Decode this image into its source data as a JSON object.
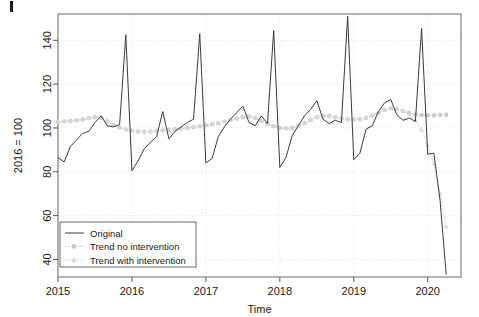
{
  "chart_data": {
    "type": "line",
    "title": "",
    "xlabel": "Time",
    "ylabel": "2016 = 100",
    "xlim": [
      2015.0,
      2020.45
    ],
    "ylim": [
      32,
      152
    ],
    "grid": true,
    "x_ticks": [
      2015,
      2016,
      2017,
      2018,
      2019,
      2020
    ],
    "x_tick_labels": [
      "2015",
      "2016",
      "2017",
      "2018",
      "2019",
      "2020"
    ],
    "y_ticks": [
      40,
      60,
      80,
      100,
      120,
      140
    ],
    "y_tick_labels": [
      "40",
      "60",
      "80",
      "100",
      "120",
      "140"
    ],
    "legend_position": "bottom-left",
    "colors": {
      "original": "#3a3a3a",
      "trend_no_intervention": "#c9c9c9",
      "trend_with_intervention": "#d6d6d6",
      "axis": "#555555",
      "grid": "#e4e4e4",
      "box": "#6b6b6b"
    },
    "x": [
      2015.0,
      2015.083,
      2015.167,
      2015.25,
      2015.333,
      2015.417,
      2015.5,
      2015.583,
      2015.667,
      2015.75,
      2015.833,
      2015.917,
      2016.0,
      2016.083,
      2016.167,
      2016.25,
      2016.333,
      2016.417,
      2016.5,
      2016.583,
      2016.667,
      2016.75,
      2016.833,
      2016.917,
      2017.0,
      2017.083,
      2017.167,
      2017.25,
      2017.333,
      2017.417,
      2017.5,
      2017.583,
      2017.667,
      2017.75,
      2017.833,
      2017.917,
      2018.0,
      2018.083,
      2018.167,
      2018.25,
      2018.333,
      2018.417,
      2018.5,
      2018.583,
      2018.667,
      2018.75,
      2018.833,
      2018.917,
      2019.0,
      2019.083,
      2019.167,
      2019.25,
      2019.333,
      2019.417,
      2019.5,
      2019.583,
      2019.667,
      2019.75,
      2019.833,
      2019.917,
      2020.0,
      2020.083,
      2020.167,
      2020.25
    ],
    "series": [
      {
        "name": "Original",
        "style": "solid-line",
        "values": [
          86.5,
          84.5,
          91.5,
          94.5,
          97.5,
          98.5,
          102.5,
          105.5,
          101.0,
          100.5,
          101.5,
          142.5,
          80.5,
          85.0,
          90.5,
          93.5,
          96.0,
          107.5,
          95.0,
          98.5,
          100.5,
          102.5,
          104.0,
          143.0,
          84.0,
          86.0,
          96.0,
          100.5,
          104.0,
          107.0,
          110.0,
          102.5,
          101.0,
          105.5,
          102.0,
          144.5,
          82.0,
          86.5,
          96.5,
          101.0,
          105.5,
          108.5,
          112.5,
          104.0,
          102.0,
          103.5,
          102.5,
          151.0,
          85.5,
          88.5,
          99.5,
          101.0,
          107.5,
          111.5,
          113.0,
          106.0,
          103.5,
          104.5,
          103.0,
          145.5,
          88.0,
          88.5,
          67.0,
          33.0
        ]
      },
      {
        "name": "Trend no intervention",
        "style": "dotted-line-circles",
        "values": [
          102.8,
          103.0,
          103.2,
          103.5,
          103.9,
          104.4,
          104.9,
          104.6,
          103.0,
          101.4,
          100.2,
          99.3,
          98.7,
          98.4,
          98.3,
          98.4,
          98.6,
          98.9,
          99.1,
          99.4,
          99.7,
          100.0,
          100.4,
          100.8,
          101.2,
          101.7,
          102.2,
          102.9,
          103.6,
          104.3,
          105.0,
          105.2,
          104.6,
          103.3,
          101.9,
          100.8,
          100.1,
          99.8,
          100.0,
          100.8,
          102.1,
          103.6,
          104.9,
          105.6,
          105.5,
          104.9,
          104.3,
          103.9,
          103.8,
          104.0,
          104.6,
          105.6,
          106.9,
          108.2,
          109.0,
          108.7,
          107.7,
          106.8,
          106.2,
          105.9,
          105.8,
          105.8,
          105.9,
          106.0
        ]
      },
      {
        "name": "Trend with intervention",
        "style": "dotted-line-triangles",
        "values": [
          102.9,
          103.1,
          103.3,
          103.6,
          104.0,
          104.5,
          105.0,
          104.7,
          103.1,
          101.5,
          100.3,
          99.4,
          98.8,
          98.5,
          98.4,
          98.5,
          98.7,
          99.0,
          99.2,
          99.5,
          99.8,
          100.1,
          100.5,
          100.9,
          101.3,
          101.8,
          102.3,
          103.0,
          103.7,
          104.4,
          105.1,
          105.3,
          104.7,
          103.4,
          102.0,
          100.9,
          100.2,
          99.9,
          100.1,
          100.9,
          102.2,
          103.7,
          105.0,
          105.7,
          105.6,
          105.0,
          104.4,
          104.0,
          103.9,
          104.1,
          104.7,
          105.7,
          107.0,
          108.3,
          109.1,
          108.8,
          107.8,
          106.0,
          103.5,
          99.0,
          92.0,
          83.5,
          70.0,
          55.0
        ]
      }
    ]
  },
  "axes": {
    "x_axis_title": "Time",
    "y_axis_title": "2016 = 100"
  },
  "legend": {
    "entries": [
      {
        "label": "Original",
        "marker": "line"
      },
      {
        "label": "Trend no intervention",
        "marker": "circle"
      },
      {
        "label": "Trend with intervention",
        "marker": "triangle"
      }
    ]
  }
}
